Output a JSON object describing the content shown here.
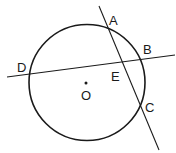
{
  "diagram": {
    "type": "geometry-circle-intersecting-chords",
    "stroke_color": "#1a1a1a",
    "background": "#ffffff",
    "circle": {
      "center_label": "O",
      "cx": 87,
      "cy": 82.5,
      "r": 58
    },
    "lines": [
      {
        "name": "line-AC",
        "x1": 99,
        "y1": 6,
        "x2": 159,
        "y2": 150
      },
      {
        "name": "line-DB",
        "x1": 7,
        "y1": 77,
        "x2": 175,
        "y2": 55
      }
    ],
    "points": [
      {
        "label": "A",
        "lx": 109,
        "ly": 25
      },
      {
        "label": "B",
        "lx": 143,
        "ly": 54
      },
      {
        "label": "D",
        "lx": 17,
        "ly": 72
      },
      {
        "label": "E",
        "lx": 111,
        "ly": 81
      },
      {
        "label": "C",
        "lx": 145,
        "ly": 112
      },
      {
        "label": "O",
        "lx": 82,
        "ly": 100
      }
    ],
    "center_dot": {
      "x": 86,
      "y": 83
    }
  },
  "labels": {
    "A": "A",
    "B": "B",
    "C": "C",
    "D": "D",
    "E": "E",
    "O": "O"
  }
}
